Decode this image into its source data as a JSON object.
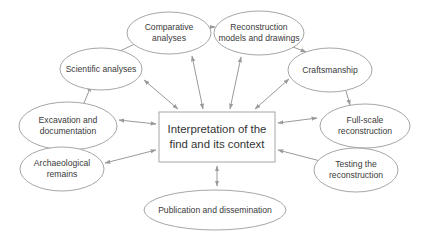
{
  "diagram": {
    "colors": {
      "background": "#ffffff",
      "shape_fill": "#ffffff",
      "shape_stroke": "#a6a6a6",
      "arrow": "#9a9a9a",
      "text": "#3a3a3a"
    },
    "center": {
      "label": "Interpretation of the\nfind and its context"
    },
    "nodes": [
      {
        "id": "comparative",
        "label": "Comparative\nanalyses"
      },
      {
        "id": "reconstruction-models",
        "label": "Reconstruction\nmodels and drawings"
      },
      {
        "id": "scientific",
        "label": "Scientific analyses"
      },
      {
        "id": "craftsmanship",
        "label": "Craftsmanship"
      },
      {
        "id": "excavation",
        "label": "Excavation and\ndocumentation"
      },
      {
        "id": "full-scale",
        "label": "Full-scale\nreconstruction"
      },
      {
        "id": "archaeological",
        "label": "Archaeological\nremains"
      },
      {
        "id": "testing",
        "label": "Testing the\nreconstruction"
      },
      {
        "id": "publication",
        "label": "Publication and dissemination"
      }
    ],
    "edges": [
      {
        "from": "archaeological",
        "to": "excavation",
        "type": "one-way"
      },
      {
        "from": "excavation",
        "to": "scientific",
        "type": "one-way"
      },
      {
        "from": "scientific",
        "to": "comparative",
        "type": "one-way"
      },
      {
        "from": "comparative",
        "to": "reconstruction-models",
        "type": "one-way"
      },
      {
        "from": "reconstruction-models",
        "to": "craftsmanship",
        "type": "one-way"
      },
      {
        "from": "craftsmanship",
        "to": "full-scale",
        "type": "one-way"
      },
      {
        "from": "full-scale",
        "to": "testing",
        "type": "one-way"
      },
      {
        "from": "center",
        "to": "archaeological",
        "type": "two-way"
      },
      {
        "from": "center",
        "to": "excavation",
        "type": "two-way"
      },
      {
        "from": "center",
        "to": "scientific",
        "type": "two-way"
      },
      {
        "from": "center",
        "to": "comparative",
        "type": "two-way"
      },
      {
        "from": "center",
        "to": "reconstruction-models",
        "type": "two-way"
      },
      {
        "from": "center",
        "to": "craftsmanship",
        "type": "two-way"
      },
      {
        "from": "center",
        "to": "full-scale",
        "type": "two-way"
      },
      {
        "from": "center",
        "to": "testing",
        "type": "two-way"
      },
      {
        "from": "center",
        "to": "publication",
        "type": "two-way"
      }
    ]
  }
}
